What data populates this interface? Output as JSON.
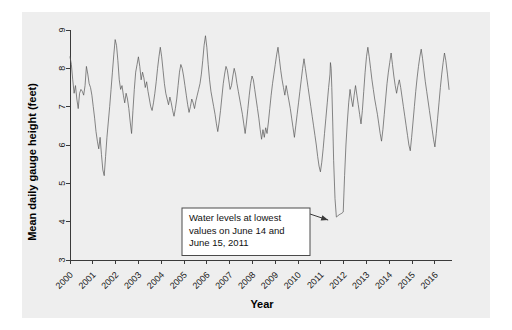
{
  "chart_data": {
    "type": "line",
    "title": "",
    "xlabel": "Year",
    "ylabel": "Mean daily gauge height (feet)",
    "xlim": [
      2000,
      2016.75
    ],
    "ylim": [
      3,
      9
    ],
    "grid": false,
    "legend": "none",
    "xticks": [
      "2000",
      "2001",
      "2002",
      "2003",
      "2004",
      "2005",
      "2006",
      "2007",
      "2008",
      "2009",
      "2010",
      "2011",
      "2012",
      "2013",
      "2014",
      "2015",
      "2016"
    ],
    "yticks": [
      "3",
      "4",
      "5",
      "6",
      "7",
      "8",
      "9"
    ],
    "series": [
      {
        "name": "Mean daily gauge height",
        "color": "#555555",
        "x": [
          2000.0,
          2000.06,
          2000.12,
          2000.18,
          2000.24,
          2000.3,
          2000.36,
          2000.42,
          2000.48,
          2000.54,
          2000.6,
          2000.66,
          2000.72,
          2000.78,
          2000.84,
          2000.9,
          2000.96,
          2001.02,
          2001.08,
          2001.14,
          2001.2,
          2001.26,
          2001.32,
          2001.38,
          2001.44,
          2001.5,
          2001.56,
          2001.62,
          2001.68,
          2001.74,
          2001.8,
          2001.86,
          2001.92,
          2001.98,
          2002.04,
          2002.1,
          2002.16,
          2002.22,
          2002.28,
          2002.34,
          2002.4,
          2002.46,
          2002.52,
          2002.58,
          2002.64,
          2002.7,
          2002.76,
          2002.82,
          2002.88,
          2002.94,
          2003.0,
          2003.06,
          2003.12,
          2003.18,
          2003.24,
          2003.3,
          2003.36,
          2003.42,
          2003.48,
          2003.54,
          2003.6,
          2003.66,
          2003.72,
          2003.78,
          2003.84,
          2003.9,
          2003.96,
          2004.02,
          2004.08,
          2004.14,
          2004.2,
          2004.26,
          2004.32,
          2004.38,
          2004.44,
          2004.5,
          2004.56,
          2004.62,
          2004.68,
          2004.74,
          2004.8,
          2004.86,
          2004.92,
          2004.98,
          2005.04,
          2005.1,
          2005.16,
          2005.22,
          2005.28,
          2005.34,
          2005.4,
          2005.46,
          2005.52,
          2005.58,
          2005.64,
          2005.7,
          2005.76,
          2005.82,
          2005.88,
          2005.94,
          2006.0,
          2006.06,
          2006.12,
          2006.18,
          2006.24,
          2006.3,
          2006.36,
          2006.42,
          2006.48,
          2006.54,
          2006.6,
          2006.66,
          2006.72,
          2006.78,
          2006.84,
          2006.9,
          2006.96,
          2007.02,
          2007.08,
          2007.14,
          2007.2,
          2007.26,
          2007.32,
          2007.38,
          2007.44,
          2007.5,
          2007.56,
          2007.62,
          2007.68,
          2007.74,
          2007.8,
          2007.86,
          2007.92,
          2007.98,
          2008.04,
          2008.1,
          2008.16,
          2008.22,
          2008.28,
          2008.34,
          2008.4,
          2008.46,
          2008.52,
          2008.58,
          2008.64,
          2008.7,
          2008.76,
          2008.82,
          2008.88,
          2008.94,
          2009.0,
          2009.06,
          2009.12,
          2009.18,
          2009.24,
          2009.3,
          2009.36,
          2009.42,
          2009.48,
          2009.54,
          2009.6,
          2009.66,
          2009.72,
          2009.78,
          2009.84,
          2009.9,
          2009.96,
          2010.02,
          2010.08,
          2010.14,
          2010.2,
          2010.26,
          2010.32,
          2010.38,
          2010.44,
          2010.5,
          2010.56,
          2010.62,
          2010.68,
          2010.74,
          2010.8,
          2010.86,
          2010.92,
          2010.98,
          2011.04,
          2011.1,
          2011.16,
          2011.22,
          2011.28,
          2011.34,
          2011.4,
          2011.42,
          2011.45,
          2011.48,
          2011.52,
          2011.56,
          2011.62,
          2011.68,
          2011.74,
          2011.8,
          2011.86,
          2011.92,
          2011.98,
          2012.04,
          2012.1,
          2012.16,
          2012.22,
          2012.28,
          2012.34,
          2012.4,
          2012.46,
          2012.52,
          2012.58,
          2012.64,
          2012.7,
          2012.76,
          2012.82,
          2012.88,
          2012.94,
          2013.0,
          2013.06,
          2013.12,
          2013.18,
          2013.24,
          2013.3,
          2013.36,
          2013.42,
          2013.48,
          2013.54,
          2013.6,
          2013.66,
          2013.72,
          2013.78,
          2013.84,
          2013.9,
          2013.96,
          2014.02,
          2014.08,
          2014.14,
          2014.2,
          2014.26,
          2014.32,
          2014.38,
          2014.44,
          2014.5,
          2014.56,
          2014.62,
          2014.68,
          2014.74,
          2014.8,
          2014.86,
          2014.92,
          2014.98,
          2015.04,
          2015.1,
          2015.16,
          2015.22,
          2015.28,
          2015.34,
          2015.4,
          2015.46,
          2015.52,
          2015.58,
          2015.64,
          2015.7,
          2015.76,
          2015.82,
          2015.88,
          2015.94,
          2016.0,
          2016.06,
          2016.12,
          2016.18,
          2016.24,
          2016.3,
          2016.36,
          2016.42,
          2016.48,
          2016.55,
          2016.62
        ],
        "y": [
          8.3,
          8.1,
          7.7,
          7.35,
          7.55,
          7.2,
          6.95,
          7.35,
          7.45,
          7.4,
          7.3,
          7.55,
          8.05,
          7.85,
          7.6,
          7.5,
          7.3,
          7.0,
          6.7,
          6.35,
          6.1,
          5.9,
          6.2,
          5.75,
          5.35,
          5.2,
          5.7,
          6.2,
          6.6,
          7.0,
          7.45,
          7.9,
          8.35,
          8.75,
          8.6,
          8.2,
          7.7,
          7.45,
          7.55,
          7.3,
          7.1,
          7.35,
          7.2,
          6.95,
          6.6,
          6.3,
          6.9,
          7.45,
          7.9,
          8.1,
          8.3,
          8.05,
          7.7,
          7.9,
          7.75,
          7.5,
          7.65,
          7.4,
          7.2,
          7.0,
          6.9,
          7.1,
          7.35,
          7.65,
          8.0,
          8.3,
          8.55,
          8.3,
          7.95,
          7.6,
          7.35,
          7.2,
          7.05,
          7.25,
          7.1,
          6.9,
          6.75,
          6.95,
          7.2,
          7.55,
          7.9,
          8.1,
          8.0,
          7.8,
          7.55,
          7.3,
          7.05,
          6.85,
          7.0,
          7.2,
          7.1,
          6.95,
          7.15,
          7.3,
          7.45,
          7.6,
          7.85,
          8.2,
          8.6,
          8.85,
          8.55,
          8.1,
          7.7,
          7.4,
          7.2,
          7.0,
          6.8,
          6.55,
          6.35,
          6.6,
          6.9,
          7.25,
          7.6,
          7.85,
          8.05,
          7.95,
          7.7,
          7.45,
          7.55,
          7.8,
          8.0,
          7.85,
          7.6,
          7.4,
          7.2,
          7.0,
          6.8,
          6.55,
          6.3,
          6.6,
          6.95,
          7.3,
          7.6,
          7.8,
          7.7,
          7.45,
          7.2,
          6.95,
          6.7,
          6.4,
          6.15,
          6.4,
          6.2,
          6.45,
          6.3,
          6.6,
          6.95,
          7.3,
          7.6,
          7.85,
          8.1,
          8.35,
          8.55,
          8.25,
          7.95,
          7.7,
          7.5,
          7.3,
          7.55,
          7.35,
          7.15,
          6.95,
          6.7,
          6.45,
          6.2,
          6.5,
          6.8,
          7.1,
          7.4,
          7.7,
          8.0,
          8.25,
          8.0,
          7.75,
          7.5,
          7.25,
          7.0,
          6.75,
          6.5,
          6.25,
          6.0,
          5.7,
          5.45,
          5.3,
          5.55,
          5.9,
          6.3,
          6.7,
          7.1,
          7.5,
          7.85,
          8.15,
          8.0,
          7.5,
          6.6,
          5.6,
          4.6,
          4.12,
          4.15,
          4.18,
          4.2,
          4.22,
          4.25,
          5.2,
          6.0,
          6.6,
          7.1,
          7.45,
          7.2,
          7.0,
          7.3,
          7.55,
          7.3,
          7.05,
          6.8,
          6.55,
          6.9,
          7.4,
          7.9,
          8.3,
          8.55,
          8.3,
          8.0,
          7.7,
          7.45,
          7.2,
          7.0,
          6.8,
          6.55,
          6.3,
          6.1,
          6.4,
          6.8,
          7.2,
          7.6,
          7.9,
          8.15,
          8.4,
          8.1,
          7.8,
          7.55,
          7.35,
          7.55,
          7.7,
          7.5,
          7.25,
          7.0,
          6.75,
          6.5,
          6.25,
          6.0,
          5.85,
          6.2,
          6.6,
          7.0,
          7.4,
          7.75,
          8.05,
          8.3,
          8.5,
          8.25,
          7.95,
          7.65,
          7.4,
          7.15,
          6.9,
          6.65,
          6.4,
          6.15,
          5.95,
          6.3,
          6.7,
          7.1,
          7.5,
          7.85,
          8.15,
          8.4,
          8.2,
          7.85,
          7.45
        ]
      }
    ],
    "annotation": {
      "text_lines": [
        "Water levels at lowest",
        "values on June 14 and",
        "June 15, 2011"
      ],
      "points_to_x": 2011.32,
      "points_to_y": 4.12
    }
  }
}
